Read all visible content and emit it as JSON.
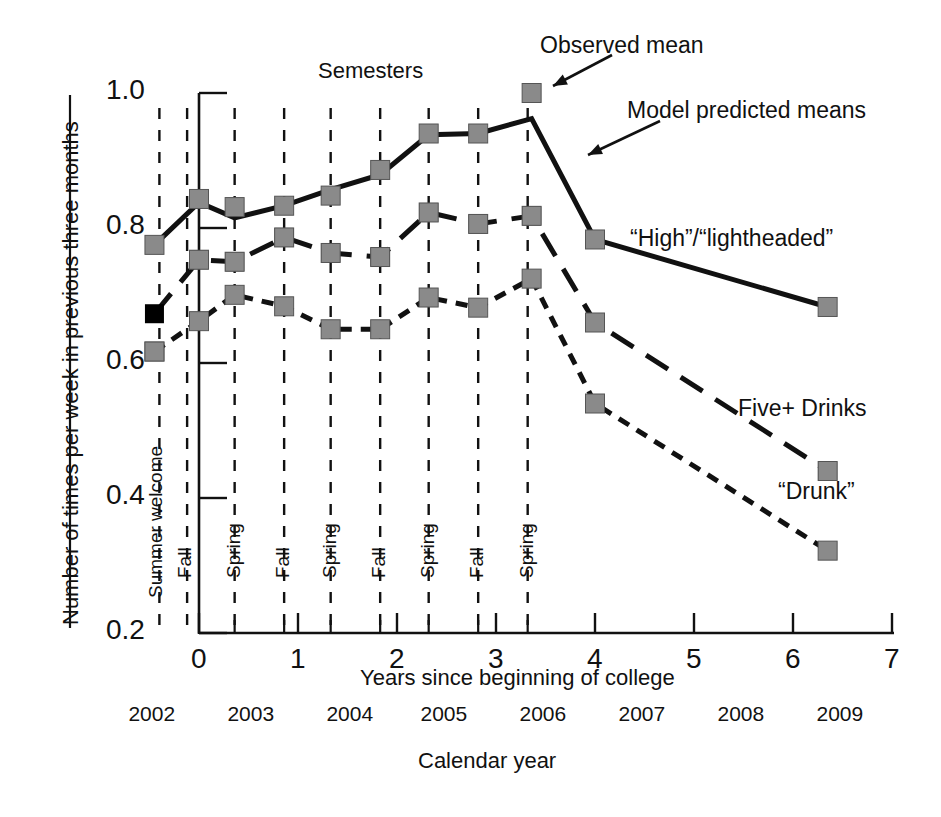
{
  "figure": {
    "background": "#ffffff",
    "ink": "#111111",
    "observed_marker_color": "#8a8a8a",
    "predicted_marker_color": "#000000",
    "top_label": "Semesters"
  },
  "axes": {
    "y": {
      "label": "Number of times per week in previous three months",
      "ticks": [
        "1.0",
        "0.8",
        "0.6",
        "0.4",
        "0.2"
      ],
      "tick_values": [
        1.0,
        0.8,
        0.6,
        0.4,
        0.2
      ],
      "range": [
        0.2,
        1.0
      ]
    },
    "x_primary": {
      "label": "Years since beginning of college",
      "ticks": [
        "0",
        "1",
        "2",
        "3",
        "4",
        "5",
        "6",
        "7"
      ],
      "tick_values": [
        0,
        1,
        2,
        3,
        4,
        5,
        6,
        7
      ],
      "range": [
        0,
        7
      ]
    },
    "x_secondary": {
      "label": "Calendar year",
      "ticks": [
        "2002",
        "2003",
        "2004",
        "2005",
        "2006",
        "2007",
        "2008",
        "2009"
      ],
      "tick_x": [
        -0.45,
        0.55,
        1.55,
        2.5,
        3.5,
        4.5,
        5.5,
        6.5
      ]
    }
  },
  "period_labels": [
    {
      "text": "Summer welcome",
      "x": -0.45
    },
    {
      "text": "Fall",
      "x": -0.16
    },
    {
      "text": "Spring",
      "x": 0.33
    },
    {
      "text": "Fall",
      "x": 0.83
    },
    {
      "text": "Spring",
      "x": 1.3
    },
    {
      "text": "Fall",
      "x": 1.8
    },
    {
      "text": "Spring",
      "x": 2.29
    },
    {
      "text": "Fall",
      "x": 2.79
    },
    {
      "text": "Spring",
      "x": 3.29
    }
  ],
  "separator_lines_x": [
    -0.4,
    -0.12,
    0.36,
    0.86,
    1.33,
    1.83,
    2.32,
    2.82,
    3.32
  ],
  "annotations": [
    {
      "name": "observed-mean",
      "text": "Observed mean",
      "text_x": 540,
      "text_y": 32,
      "arrow": {
        "x1": 612,
        "y1": 55,
        "x2": 553,
        "y2": 86
      }
    },
    {
      "name": "model-predicted-means",
      "text": "Model predicted means",
      "text_x": 627,
      "text_y": 97,
      "arrow": {
        "x1": 660,
        "y1": 121,
        "x2": 588,
        "y2": 155
      }
    },
    {
      "name": "high-lightheaded",
      "text": "“High”/“lightheaded”",
      "text_x": 630,
      "text_y": 225
    },
    {
      "name": "five-plus-drinks",
      "text": "Five+ Drinks",
      "text_x": 738,
      "text_y": 395
    },
    {
      "name": "drunk",
      "text": "“Drunk”",
      "text_x": 778,
      "text_y": 478
    }
  ],
  "chart_data": {
    "type": "line",
    "title": "",
    "xlabel": "Years since beginning of college",
    "ylabel": "Number of times per week in previous three months",
    "xlim": [
      0,
      7
    ],
    "ylim": [
      0.2,
      1.0
    ],
    "grid": false,
    "legend_position": "inline-annotations",
    "series": [
      {
        "name": "“High”/“lightheaded”",
        "style": "solid",
        "predicted": {
          "x": [
            -0.45,
            0.0,
            0.36,
            0.86,
            1.33,
            1.83,
            2.32,
            2.82,
            3.36,
            4.0,
            6.35
          ],
          "y": [
            0.775,
            0.838,
            0.815,
            0.833,
            0.857,
            0.879,
            0.938,
            0.94,
            0.962,
            0.783,
            0.683
          ]
        },
        "observed": {
          "x": [
            -0.45,
            0.0,
            0.36,
            0.86,
            1.33,
            1.83,
            2.32,
            2.82,
            3.36,
            4.0,
            6.35
          ],
          "y": [
            0.775,
            0.843,
            0.831,
            0.833,
            0.848,
            0.886,
            0.94,
            0.94,
            1.0,
            0.783,
            0.683
          ]
        }
      },
      {
        "name": "Five+ Drinks",
        "style": "dashed",
        "predicted": {
          "x": [
            -0.45,
            0.0,
            0.36,
            0.86,
            1.33,
            1.83,
            2.32,
            2.82,
            3.36,
            4.0,
            6.35
          ],
          "y": [
            0.673,
            0.753,
            0.75,
            0.786,
            0.763,
            0.757,
            0.823,
            0.806,
            0.818,
            0.66,
            0.44
          ]
        },
        "observed": {
          "x": [
            -0.45,
            0.0,
            0.36,
            0.86,
            1.33,
            1.83,
            2.32,
            2.82,
            3.36,
            4.0,
            6.35
          ],
          "y": [
            0.617,
            0.753,
            0.75,
            0.786,
            0.763,
            0.757,
            0.823,
            0.806,
            0.818,
            0.66,
            0.44
          ]
        }
      },
      {
        "name": "“Drunk”",
        "style": "dotted-dashed",
        "predicted": {
          "x": [
            -0.45,
            0.0,
            0.36,
            0.86,
            1.33,
            1.83,
            2.32,
            2.82,
            3.36,
            4.0,
            6.35
          ],
          "y": [
            0.617,
            0.662,
            0.701,
            0.684,
            0.65,
            0.65,
            0.697,
            0.682,
            0.725,
            0.54,
            0.322
          ]
        },
        "observed": {
          "x": [
            -0.45,
            0.0,
            0.36,
            0.86,
            1.33,
            1.83,
            2.32,
            2.82,
            3.36,
            4.0,
            6.35
          ],
          "y": [
            0.617,
            0.662,
            0.701,
            0.684,
            0.65,
            0.65,
            0.697,
            0.682,
            0.725,
            0.54,
            0.322
          ]
        }
      }
    ]
  }
}
